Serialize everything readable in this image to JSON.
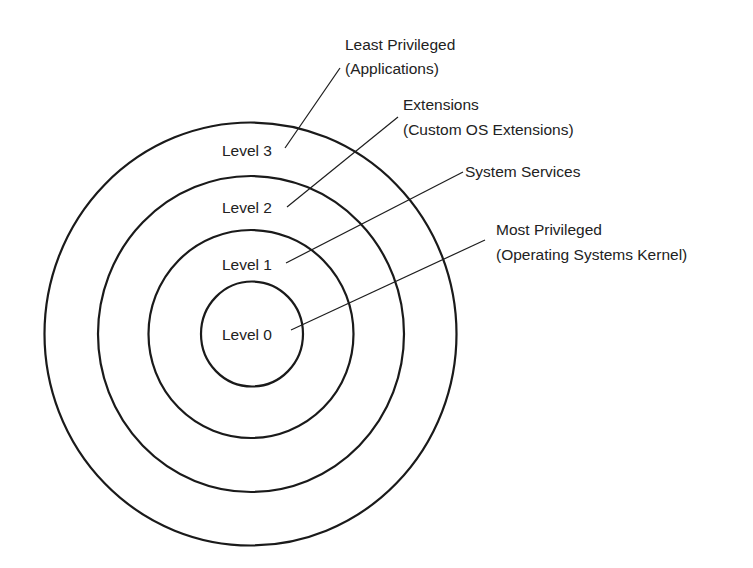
{
  "diagram": {
    "type": "concentric-protection-rings",
    "colors": {
      "background": "#ffffff",
      "line": "#1a1a1a",
      "text": "#222222"
    },
    "rings": [
      {
        "level": 0,
        "label": "Level 0",
        "cx": 252,
        "cy": 334,
        "rx": 51,
        "ry": 52.5,
        "label_x": 222,
        "label_y": 340
      },
      {
        "level": 1,
        "label": "Level 1",
        "cx": 251,
        "cy": 334,
        "rx": 102.5,
        "ry": 104,
        "label_x": 222,
        "label_y": 270
      },
      {
        "level": 2,
        "label": "Level 2",
        "cx": 251,
        "cy": 334,
        "rx": 153,
        "ry": 158,
        "label_x": 222,
        "label_y": 213
      },
      {
        "level": 3,
        "label": "Level 3",
        "cx": 250.5,
        "cy": 334,
        "rx": 206,
        "ry": 211.5,
        "label_x": 222,
        "label_y": 156
      }
    ],
    "annotations": [
      {
        "level": 3,
        "line_1": "Least Privileged",
        "line_2": "(Applications)",
        "text_x": 345,
        "text_y1": 50,
        "text_y2": 74,
        "leader": {
          "x1": 285,
          "y1": 148,
          "x2": 340,
          "y2": 68
        }
      },
      {
        "level": 2,
        "line_1": "Extensions",
        "line_2": "(Custom OS Extensions)",
        "text_x": 403,
        "text_y1": 110,
        "text_y2": 135,
        "leader": {
          "x1": 287,
          "y1": 207,
          "x2": 398,
          "y2": 117
        }
      },
      {
        "level": 1,
        "line_1": "System Services",
        "line_2": "",
        "text_x": 465,
        "text_y1": 177,
        "text_y2": 0,
        "leader": {
          "x1": 286,
          "y1": 263,
          "x2": 463,
          "y2": 172
        }
      },
      {
        "level": 0,
        "line_1": "Most Privileged",
        "line_2": "(Operating Systems Kernel)",
        "text_x": 496,
        "text_y1": 235,
        "text_y2": 260,
        "leader": {
          "x1": 291,
          "y1": 330,
          "x2": 485,
          "y2": 240
        }
      }
    ]
  }
}
